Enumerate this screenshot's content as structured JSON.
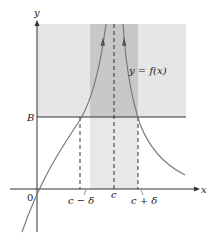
{
  "diagram": {
    "axis_labels": {
      "x": "x",
      "y": "y",
      "origin": "0"
    },
    "bound_label": "B",
    "curve_label": "y = f(x)",
    "tick_labels": {
      "left": "c − δ",
      "center": "c",
      "right": "c + δ"
    },
    "colors": {
      "region_light": "#e6e6e6",
      "band_dark": "#c8c8c8",
      "band_light": "#e8e8e8",
      "curve": "#7a7a7a",
      "axis": "#333333"
    }
  }
}
